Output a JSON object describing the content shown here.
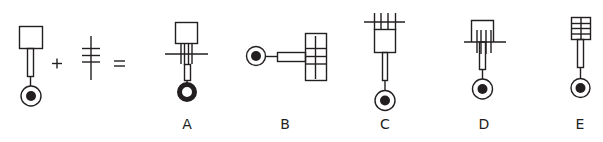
{
  "puzzle": {
    "type": "figure-combination",
    "operators": {
      "plus": "+",
      "equals": "="
    },
    "premise": [
      {
        "id": "premise-key",
        "description": "square head on a stem ending in a circle with dark dot"
      },
      {
        "id": "premise-ladder",
        "description": "vertical line crossed by three short horizontal lines"
      }
    ],
    "options": [
      {
        "letter": "A",
        "x": 186
      },
      {
        "letter": "B",
        "x": 285
      },
      {
        "letter": "C",
        "x": 384
      },
      {
        "letter": "D",
        "x": 484
      },
      {
        "letter": "E",
        "x": 580
      }
    ]
  },
  "colors": {
    "ink": "#231f20",
    "background": "#ffffff"
  }
}
